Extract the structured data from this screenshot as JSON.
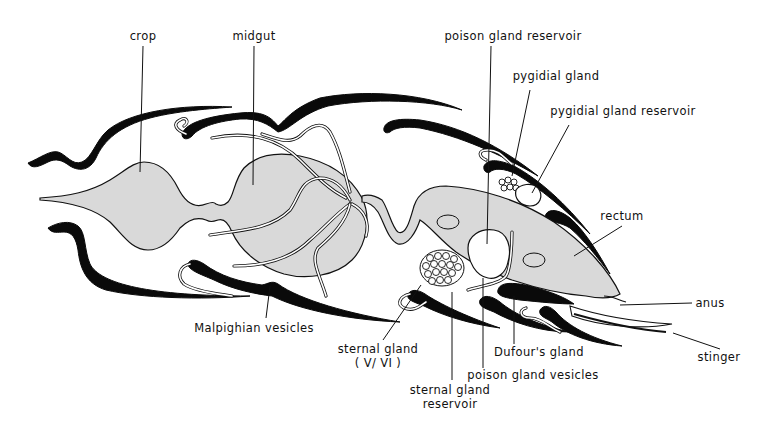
{
  "diagram": {
    "type": "anatomical-cross-section",
    "colors": {
      "background": "#ffffff",
      "line": "#111111",
      "organ_fill": "#d9d9d9",
      "cuticle_plates": "#0a0a0a"
    },
    "labels": [
      {
        "id": "crop",
        "text": "crop",
        "x": 143,
        "y": 40
      },
      {
        "id": "midgut",
        "text": "midgut",
        "x": 254,
        "y": 40
      },
      {
        "id": "poison-gland-reservoir",
        "text": "poison gland reservoir",
        "x": 513,
        "y": 40
      },
      {
        "id": "pygidial-gland",
        "text": "pygidial gland",
        "x": 556,
        "y": 80
      },
      {
        "id": "pygidial-gland-reservoir",
        "text": "pygidial gland reservoir",
        "x": 623,
        "y": 115
      },
      {
        "id": "rectum",
        "text": "rectum",
        "x": 622,
        "y": 220
      },
      {
        "id": "anus",
        "text": "anus",
        "x": 710,
        "y": 304
      },
      {
        "id": "stinger",
        "text": "stinger",
        "x": 717,
        "y": 361
      },
      {
        "id": "malpighian-vesicles",
        "text": "Malpighian vesicles",
        "x": 254,
        "y": 332
      },
      {
        "id": "sternal-gland",
        "text": "sternal gland",
        "x": 378,
        "y": 353
      },
      {
        "id": "sternal-gland-segments",
        "text": "( V/ VI )",
        "x": 378,
        "y": 367
      },
      {
        "id": "sternal-gland-reservoir",
        "text": "sternal gland",
        "x": 449,
        "y": 394
      },
      {
        "id": "sternal-gland-reservoir-2",
        "text": "reservoir",
        "x": 449,
        "y": 408
      },
      {
        "id": "dufours-gland",
        "text": "Dufour's gland",
        "x": 539,
        "y": 356
      },
      {
        "id": "poison-gland-vesicles",
        "text": "poison gland vesicles",
        "x": 532,
        "y": 378
      }
    ]
  }
}
